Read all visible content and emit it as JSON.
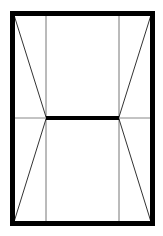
{
  "diagram": {
    "type": "line-drawing",
    "colors": {
      "background": "#ffffff",
      "frame": "#000000",
      "thin_lines": "#555555",
      "center_bar": "#000000"
    },
    "frame": {
      "x": 12,
      "y": 13,
      "width": 141,
      "height": 211,
      "stroke_width": 5
    },
    "inner_verticals": [
      46,
      119
    ],
    "center_bar": {
      "x1": 46,
      "x2": 119,
      "y": 118,
      "stroke_width": 4
    },
    "center_line_y": 118
  }
}
